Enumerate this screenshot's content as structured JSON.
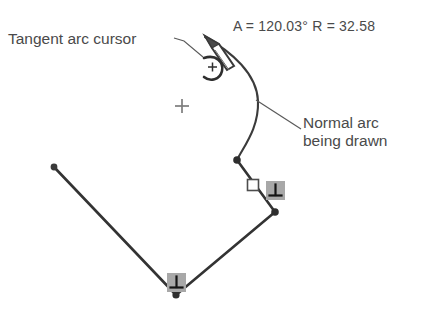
{
  "app": {
    "title": "Tangent arc cursor sketch illustration",
    "background_color": "#ffffff"
  },
  "readout": {
    "text": "A = 120.03° R = 32.58",
    "angle_label": "A",
    "angle_value": "120.03°",
    "radius_label": "R",
    "radius_value": "32.58",
    "color": "#4a4a4a"
  },
  "annotations": [
    {
      "name": "tangent-arc-cursor",
      "text": "Tangent arc cursor",
      "leader_from": [
        176,
        40
      ],
      "leader_to": [
        200,
        55
      ],
      "color": "#4a4a4a"
    },
    {
      "name": "normal-arc-being-drawn",
      "line1": "Normal arc",
      "line2": "being drawn",
      "leader_from": [
        256,
        100
      ],
      "leader_to": [
        300,
        128
      ],
      "color": "#4a4a4a"
    }
  ],
  "cursor": {
    "name": "tangent-arc-pencil-cursor",
    "tip": [
      205,
      36
    ],
    "pencil_color": "#3a3a3a",
    "symbol": "tangent-arc-with-crosshair",
    "symbol_center": [
      213,
      67
    ]
  },
  "geometry": {
    "stroke_color": "#333333",
    "arc": {
      "name": "normal-arc-being-drawn",
      "start": [
        205,
        37
      ],
      "end": [
        237,
        160
      ],
      "bulge_peak": [
        258,
        100
      ],
      "radius": "32.58",
      "sweep_angle": "120.03°"
    },
    "polyline": {
      "name": "sketch-polyline",
      "points": [
        [
          54,
          167
        ],
        [
          237,
          160
        ],
        [
          275,
          212
        ],
        [
          176,
          295
        ],
        [
          237,
          160
        ]
      ],
      "segments": [
        {
          "from": [
            237,
            160
          ],
          "to": [
            275,
            212
          ]
        },
        {
          "from": [
            275,
            212
          ],
          "to": [
            176,
            295
          ]
        },
        {
          "from": [
            176,
            295
          ],
          "to": [
            54,
            167
          ]
        }
      ]
    },
    "nodes": [
      {
        "name": "node-endpoint-left",
        "at": [
          54,
          167
        ]
      },
      {
        "name": "node-arc-end",
        "at": [
          237,
          160
        ]
      },
      {
        "name": "node-corner-right",
        "at": [
          275,
          212
        ]
      },
      {
        "name": "node-corner-bottom",
        "at": [
          176,
          295
        ]
      }
    ],
    "midpoint_marker": {
      "name": "midpoint-square-marker",
      "at": [
        253,
        185
      ],
      "style": "hollow-square"
    },
    "crosshair_marker": {
      "name": "crosshair-marker",
      "at": [
        182,
        106
      ],
      "color": "#808080"
    },
    "constraint_glyphs": [
      {
        "name": "perpendicular-constraint-glyph",
        "at": [
          275,
          191
        ],
        "symbol": "⊥"
      },
      {
        "name": "perpendicular-constraint-glyph",
        "at": [
          176,
          283
        ],
        "symbol": "⊥"
      }
    ],
    "glyph_box_color": "#a8a8a8",
    "glyph_mark_color": "#1a1a1a"
  }
}
